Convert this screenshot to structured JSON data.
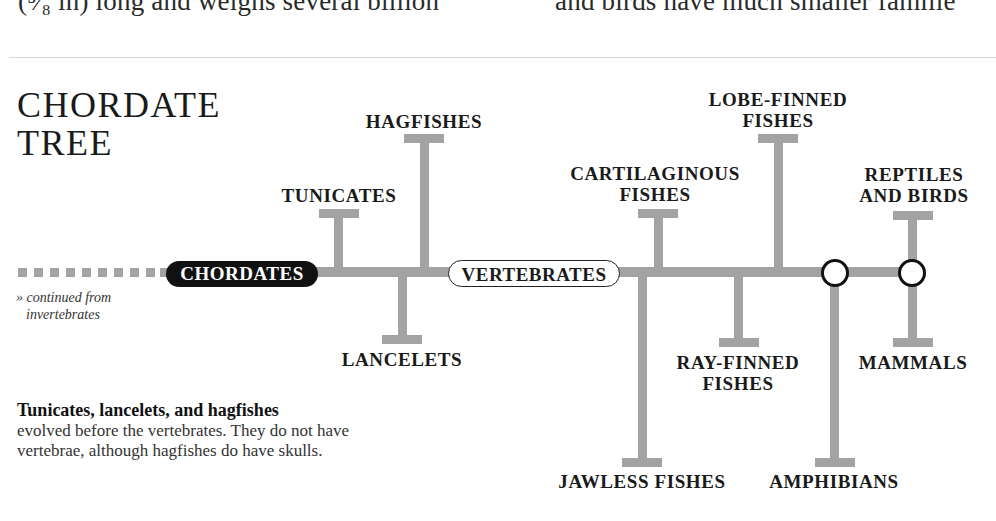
{
  "page_text": {
    "left_column_fragment": "(⁵⁄₈ in) long and weighs several billion",
    "right_column_fragment": "and birds have much smaller familie"
  },
  "title": {
    "line1": "CHORDATE",
    "line2": "TREE"
  },
  "tree": {
    "root": "CHORDATES",
    "root_note": {
      "prefix": "»",
      "line1": "continued from",
      "line2": "invertebrates"
    },
    "vertebrates_node": "VERTEBRATES",
    "branches": [
      {
        "label_lines": [
          "TUNICATES"
        ],
        "side": "up"
      },
      {
        "label_lines": [
          "LANCELETS"
        ],
        "side": "down"
      },
      {
        "label_lines": [
          "HAGFISHES"
        ],
        "side": "up"
      },
      {
        "label_lines": [
          "JAWLESS FISHES"
        ],
        "side": "down"
      },
      {
        "label_lines": [
          "CARTILAGINOUS",
          "FISHES"
        ],
        "side": "up"
      },
      {
        "label_lines": [
          "RAY-FINNED",
          "FISHES"
        ],
        "side": "down"
      },
      {
        "label_lines": [
          "LOBE-FINNED",
          "FISHES"
        ],
        "side": "up"
      },
      {
        "label_lines": [
          "AMPHIBIANS"
        ],
        "side": "down"
      },
      {
        "label_lines": [
          "REPTILES",
          "AND BIRDS"
        ],
        "side": "up"
      },
      {
        "label_lines": [
          "MAMMALS"
        ],
        "side": "down"
      }
    ]
  },
  "caption": {
    "bold": "Tunicates, lancelets, and hagfishes",
    "text": "evolved before the vertebrates. They do not have vertebrae, although hagfishes do have skulls."
  },
  "colors": {
    "branch_gray": "#a3a3a3",
    "root_pill": "#111111",
    "text": "#1a1a1a"
  }
}
